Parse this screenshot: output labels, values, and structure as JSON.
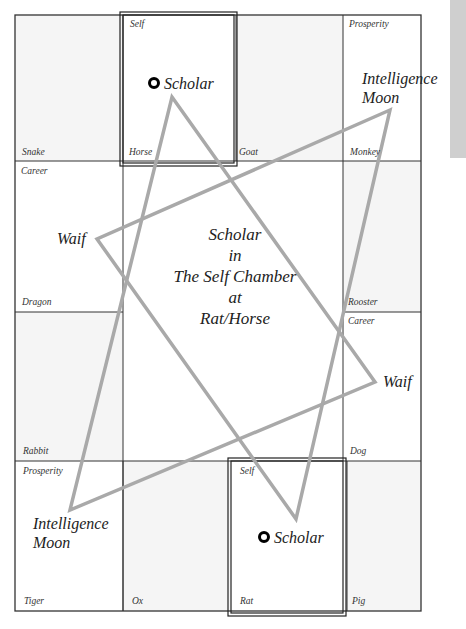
{
  "diagram": {
    "center": {
      "lines": [
        "Scholar",
        "in",
        "The Self Chamber",
        "at",
        "Rat/Horse"
      ]
    },
    "cells": [
      {
        "id": "snake",
        "animal": "Snake",
        "chamber": ""
      },
      {
        "id": "horse",
        "animal": "Horse",
        "chamber": "Self"
      },
      {
        "id": "goat",
        "animal": "Goat",
        "chamber": ""
      },
      {
        "id": "monkey",
        "animal": "Monkey",
        "chamber": "Prosperity"
      },
      {
        "id": "dragon",
        "animal": "Dragon",
        "chamber": "Career"
      },
      {
        "id": "rooster",
        "animal": "Rooster",
        "chamber": ""
      },
      {
        "id": "rabbit",
        "animal": "Rabbit",
        "chamber": ""
      },
      {
        "id": "dog",
        "animal": "Dog",
        "chamber": "Career"
      },
      {
        "id": "tiger",
        "animal": "Tiger",
        "chamber": "Prosperity"
      },
      {
        "id": "ox",
        "animal": "Ox",
        "chamber": ""
      },
      {
        "id": "rat",
        "animal": "Rat",
        "chamber": "Self"
      },
      {
        "id": "pig",
        "animal": "Pig",
        "chamber": ""
      }
    ],
    "stars": {
      "horse": "Scholar",
      "monkey_line1": "Intelligence",
      "monkey_line2": "Moon",
      "dragon": "Waif",
      "dog": "Waif",
      "tiger_line1": "Intelligence",
      "tiger_line2": "Moon",
      "rat": "Scholar"
    },
    "colors": {
      "triangle_stroke": "#a9a9a9",
      "grid_line": "#333333",
      "shaded_cell": "#f4f4f4",
      "side_strip": "#cfcfcf"
    }
  }
}
